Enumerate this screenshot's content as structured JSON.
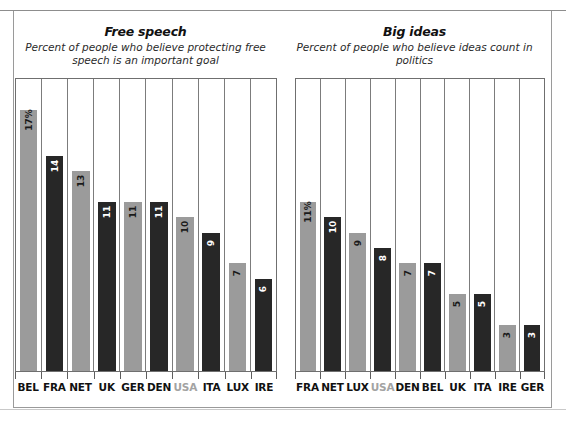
{
  "figure": {
    "background_color": "#ffffff",
    "frame_color": "#9a9a9a"
  },
  "colors": {
    "bar_light": "#9b9b9b",
    "bar_dark": "#272727",
    "highlight_label": "#a3a3a3",
    "text": "#111111"
  },
  "chart_data": [
    {
      "type": "bar",
      "title": "Free speech",
      "subtitle": "Percent of people who believe protecting free speech is an important goal",
      "xlabel": "",
      "ylabel": "",
      "ylim": [
        0,
        19
      ],
      "grid": false,
      "legend": "none",
      "highlight_category": "USA",
      "categories": [
        "BEL",
        "FRA",
        "NET",
        "UK",
        "GER",
        "DEN",
        "USA",
        "ITA",
        "LUX",
        "IRE"
      ],
      "values": [
        17,
        14,
        13,
        11,
        11,
        11,
        10,
        9,
        7,
        6
      ],
      "value_labels": [
        "17%",
        "14",
        "13",
        "11",
        "11",
        "11",
        "10",
        "9",
        "7",
        "6"
      ],
      "bar_shades": [
        "light",
        "dark",
        "light",
        "dark",
        "light",
        "dark",
        "light",
        "dark",
        "light",
        "dark"
      ]
    },
    {
      "type": "bar",
      "title": "Big ideas",
      "subtitle": "Percent of people who believe ideas count in politics",
      "xlabel": "",
      "ylabel": "",
      "ylim": [
        0,
        19
      ],
      "grid": false,
      "legend": "none",
      "highlight_category": "USA",
      "categories": [
        "FRA",
        "NET",
        "LUX",
        "USA",
        "DEN",
        "BEL",
        "UK",
        "ITA",
        "IRE",
        "GER"
      ],
      "values": [
        11,
        10,
        9,
        8,
        7,
        7,
        5,
        5,
        3,
        3
      ],
      "value_labels": [
        "11%",
        "10",
        "9",
        "8",
        "7",
        "7",
        "5",
        "5",
        "3",
        "3"
      ],
      "bar_shades": [
        "light",
        "dark",
        "light",
        "dark",
        "light",
        "dark",
        "light",
        "dark",
        "light",
        "dark"
      ]
    }
  ]
}
